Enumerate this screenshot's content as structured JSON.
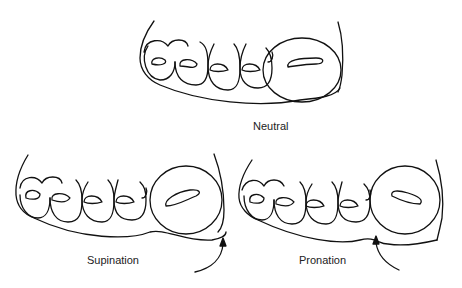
{
  "figure": {
    "panels": [
      {
        "id": "neutral",
        "label": "Neutral"
      },
      {
        "id": "supination",
        "label": "Supination"
      },
      {
        "id": "pronation",
        "label": "Pronation"
      }
    ],
    "line_color": "#111111",
    "background": "#ffffff"
  }
}
